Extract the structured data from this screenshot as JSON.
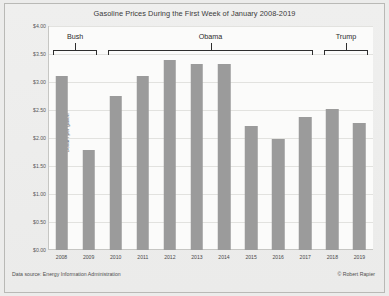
{
  "chart_data": {
    "type": "bar",
    "title": "Gasoline Prices During the First Week of January 2008-2019",
    "xlabel": "",
    "ylabel": "Dollars per gallon",
    "categories": [
      "2008",
      "2009",
      "2010",
      "2011",
      "2012",
      "2013",
      "2014",
      "2015",
      "2016",
      "2017",
      "2018",
      "2019"
    ],
    "values": [
      3.11,
      1.78,
      2.75,
      3.1,
      3.39,
      3.33,
      3.32,
      2.21,
      1.99,
      2.37,
      2.51,
      2.27
    ],
    "ylim": [
      0.0,
      4.0
    ],
    "ytick_labels": [
      "$4.00",
      "$3.50",
      "$3.00",
      "$2.50",
      "$2.00",
      "$1.50",
      "$1.00",
      "$0.50",
      "$0.00"
    ],
    "ytick_values": [
      4.0,
      3.5,
      3.0,
      2.5,
      2.0,
      1.5,
      1.0,
      0.5,
      0.0
    ],
    "grid": true,
    "legend": "none",
    "bar_color": "#9b9b9b",
    "annotations": [
      {
        "label": "Bush",
        "start_category": "2008",
        "end_category": "2009"
      },
      {
        "label": "Obama",
        "start_category": "2010",
        "end_category": "2017"
      },
      {
        "label": "Trump",
        "start_category": "2018",
        "end_category": "2019"
      }
    ],
    "source_note": "Data source: Energy Information Administration",
    "credit_note": "© Robert Rapier"
  }
}
